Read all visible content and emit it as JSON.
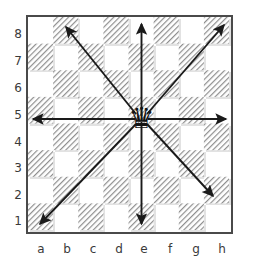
{
  "diagram": {
    "board": {
      "files": [
        "a",
        "b",
        "c",
        "d",
        "e",
        "f",
        "g",
        "h"
      ],
      "ranks": [
        "8",
        "7",
        "6",
        "5",
        "4",
        "3",
        "2",
        "1"
      ],
      "light_color": "#ffffff",
      "dark_color": "#e2e2e2",
      "border_color": "#4a4a4a",
      "dark_square_fill": "hatched",
      "orientation": "white-bottom",
      "a8_square_color": "light"
    },
    "piece": {
      "type": "queen",
      "color": "black",
      "square": "e5",
      "glyph": "♛"
    },
    "arrows": {
      "color": "#1a1a1a",
      "origin": "e5",
      "count": 8,
      "rays": [
        {
          "name": "north",
          "from": "e5",
          "to": "e8",
          "direction": "up"
        },
        {
          "name": "south",
          "from": "e5",
          "to": "e1",
          "direction": "down"
        },
        {
          "name": "west",
          "from": "e5",
          "to": "a5",
          "direction": "left"
        },
        {
          "name": "east",
          "from": "e5",
          "to": "h5",
          "direction": "right"
        },
        {
          "name": "northwest",
          "from": "e5",
          "to": "b8",
          "direction": "up-left"
        },
        {
          "name": "northeast",
          "from": "e5",
          "to": "h8",
          "direction": "up-right"
        },
        {
          "name": "southwest",
          "from": "e5",
          "to": "a1",
          "direction": "down-left"
        },
        {
          "name": "southeast",
          "from": "e5",
          "to": "h2",
          "direction": "down-right"
        }
      ]
    }
  },
  "chart_data": {
    "type": "diagram",
    "categories": [
      "a",
      "b",
      "c",
      "d",
      "e",
      "f",
      "g",
      "h"
    ],
    "values": [
      8,
      7,
      6,
      5,
      4,
      3,
      2,
      1
    ]
  }
}
